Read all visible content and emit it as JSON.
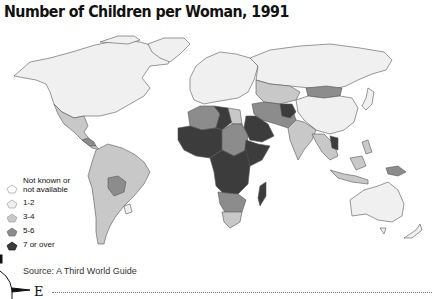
{
  "title": "Number of Children per Woman, 1991",
  "legend": {
    "items": [
      {
        "label_line1": "Not known or",
        "label_line2": "not available",
        "category": "na",
        "color": "#ffffff",
        "icon": "pentagon-outline-icon"
      },
      {
        "label_line1": "1-2",
        "category": "1-2",
        "color": "#f0f0f0",
        "icon": "pentagon-light-icon"
      },
      {
        "label_line1": "3-4",
        "category": "3-4",
        "color": "#c8c8c8",
        "icon": "pentagon-mid-light-icon"
      },
      {
        "label_line1": "5-6",
        "category": "5-6",
        "color": "#8c8c8c",
        "icon": "pentagon-mid-dark-icon"
      },
      {
        "label_line1": "7 or over",
        "category": "7+",
        "color": "#3c3c3c",
        "icon": "pentagon-dark-icon"
      }
    ]
  },
  "source": "Source: A Third World Guide",
  "compass": {
    "direction_label": "E"
  },
  "colors": {
    "na": "#ffffff",
    "c12": "#f0f0f0",
    "c34": "#c8c8c8",
    "c56": "#8c8c8c",
    "c7": "#3c3c3c",
    "border": "#555555"
  },
  "regions": [
    {
      "name": "North America",
      "category": "1-2"
    },
    {
      "name": "Greenland",
      "category": "1-2"
    },
    {
      "name": "Mexico & Central America",
      "category": "3-4"
    },
    {
      "name": "Guatemala/Honduras",
      "category": "5-6"
    },
    {
      "name": "South America",
      "category": "3-4"
    },
    {
      "name": "Bolivia",
      "category": "5-6"
    },
    {
      "name": "Uruguay",
      "category": "1-2"
    },
    {
      "name": "Europe",
      "category": "1-2"
    },
    {
      "name": "Russia/USSR",
      "category": "1-2"
    },
    {
      "name": "Central Asia",
      "category": "3-4"
    },
    {
      "name": "Mongolia",
      "category": "5-6"
    },
    {
      "name": "China",
      "category": "1-2"
    },
    {
      "name": "Afghanistan",
      "category": "7+"
    },
    {
      "name": "Iran/Pakistan",
      "category": "5-6"
    },
    {
      "name": "India",
      "category": "3-4"
    },
    {
      "name": "Arabian Peninsula",
      "category": "7+"
    },
    {
      "name": "North Africa (Algeria)",
      "category": "5-6"
    },
    {
      "name": "Libya",
      "category": "7+"
    },
    {
      "name": "Egypt",
      "category": "3-4"
    },
    {
      "name": "West Africa",
      "category": "7+"
    },
    {
      "name": "Sudan/Chad",
      "category": "5-6"
    },
    {
      "name": "Horn of Africa",
      "category": "7+"
    },
    {
      "name": "Central Africa",
      "category": "7+"
    },
    {
      "name": "Southern Africa",
      "category": "5-6"
    },
    {
      "name": "South Africa",
      "category": "3-4"
    },
    {
      "name": "Madagascar",
      "category": "7+"
    },
    {
      "name": "Southeast Asia",
      "category": "3-4"
    },
    {
      "name": "Laos",
      "category": "7+"
    },
    {
      "name": "Indonesia/Philippines",
      "category": "3-4"
    },
    {
      "name": "Papua New Guinea",
      "category": "5-6"
    },
    {
      "name": "Australia",
      "category": "1-2"
    },
    {
      "name": "New Zealand",
      "category": "1-2"
    },
    {
      "name": "Japan",
      "category": "1-2"
    }
  ]
}
